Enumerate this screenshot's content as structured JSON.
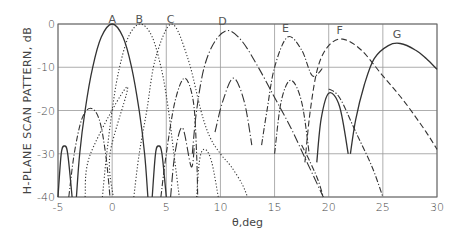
{
  "chart_data": {
    "type": "line",
    "title": "",
    "xlabel": "θ,deg",
    "ylabel": "H-PLANE SCAN PATTERN, dB",
    "xlim": [
      -5,
      30
    ],
    "ylim": [
      -40,
      0
    ],
    "xticks": [
      -5,
      0,
      5,
      10,
      15,
      20,
      25,
      30
    ],
    "xtick_labels": [
      "-5",
      "0",
      "5",
      "10",
      "15",
      "20",
      "25",
      "30"
    ],
    "yticks": [
      0,
      -10,
      -20,
      -30,
      -40
    ],
    "ytick_labels": [
      "0",
      "-10",
      "-20",
      "-30",
      "-40"
    ],
    "grid": true,
    "legend": "none — curves labeled inline A through G above their peaks",
    "series": [
      {
        "name": "A",
        "style": "solid",
        "label_x": 0,
        "peak_x": 0,
        "peak_db": 0,
        "segments": [
          [
            [
              -5,
              -40
            ],
            [
              -4.7,
              -30
            ],
            [
              -4.4,
              -28.2
            ],
            [
              -4.1,
              -30
            ],
            [
              -3.7,
              -40
            ]
          ],
          [
            [
              -3.3,
              -40
            ],
            [
              -3,
              -30
            ],
            [
              -2.5,
              -20
            ],
            [
              -1.8,
              -10
            ],
            [
              -1,
              -3
            ],
            [
              0,
              0
            ],
            [
              1,
              -3
            ],
            [
              1.8,
              -10
            ],
            [
              2.5,
              -20
            ],
            [
              3,
              -30
            ],
            [
              3.3,
              -40
            ]
          ],
          [
            [
              3.7,
              -40
            ],
            [
              4.0,
              -30
            ],
            [
              4.3,
              -28.2
            ],
            [
              4.6,
              -30
            ],
            [
              5,
              -40
            ]
          ]
        ]
      },
      {
        "name": "B",
        "style": "dotted",
        "label_x": 2.5,
        "peak_x": 2.6,
        "peak_db": 0,
        "segments": [
          [
            [
              -0.9,
              -40
            ],
            [
              -0.5,
              -30
            ],
            [
              0,
              -20
            ],
            [
              0.6,
              -11
            ],
            [
              1.5,
              -3
            ],
            [
              2.6,
              0
            ],
            [
              3.7,
              -3
            ],
            [
              4.6,
              -11
            ],
            [
              5.2,
              -20
            ],
            [
              5.7,
              -30
            ],
            [
              6.2,
              -40
            ]
          ],
          [
            [
              -2.5,
              -40
            ],
            [
              -2,
              -30
            ],
            [
              1.4,
              -14.5
            ],
            [
              -0.2,
              -30
            ],
            [
              0.1,
              -40
            ]
          ],
          [
            [
              7.8,
              -40
            ],
            [
              8.1,
              -31
            ],
            [
              8.6,
              -29
            ],
            [
              9.2,
              -32
            ],
            [
              9.8,
              -40
            ]
          ]
        ]
      },
      {
        "name": "C",
        "style": "dotted",
        "label_x": 5.4,
        "peak_x": 5.5,
        "peak_db": 0,
        "segments": [
          [
            [
              2.0,
              -40
            ],
            [
              2.5,
              -30
            ],
            [
              3.2,
              -20
            ],
            [
              4.0,
              -8
            ],
            [
              5.5,
              0
            ],
            [
              7.0,
              -8
            ],
            [
              8.2,
              -20
            ],
            [
              9.0,
              -26
            ],
            [
              10.0,
              -30
            ],
            [
              11.0,
              -33
            ],
            [
              12.0,
              -37
            ],
            [
              12.5,
              -40
            ]
          ]
        ]
      },
      {
        "name": "C-sidelobes",
        "style": "dash-dot",
        "segments": [
          [
            [
              -4.0,
              -40
            ],
            [
              -3.5,
              -30
            ],
            [
              -2.8,
              -22
            ],
            [
              -2.0,
              -19.5
            ],
            [
              -1.2,
              -22
            ],
            [
              -0.6,
              -30
            ],
            [
              -0.2,
              -40
            ]
          ],
          [
            [
              4.5,
              -40
            ],
            [
              5.0,
              -30
            ],
            [
              5.8,
              -18
            ],
            [
              6.7,
              -12.5
            ],
            [
              7.5,
              -18
            ],
            [
              7.8,
              -30
            ],
            [
              7.9,
              -40
            ]
          ]
        ]
      },
      {
        "name": "D",
        "style": "long-dash-dot",
        "label_x": 10.2,
        "peak_x": 10.7,
        "peak_db": -1.5,
        "segments": [
          [
            [
              7.4,
              -30
            ],
            [
              7.8,
              -20
            ],
            [
              8.5,
              -10
            ],
            [
              9.5,
              -4
            ],
            [
              10.7,
              -1.5
            ],
            [
              12,
              -4
            ],
            [
              13.5,
              -10
            ],
            [
              15,
              -17
            ],
            [
              16.5,
              -24
            ],
            [
              18,
              -32
            ],
            [
              19.5,
              -40
            ]
          ],
          [
            [
              5.4,
              -40
            ],
            [
              5.8,
              -30
            ],
            [
              6.5,
              -24
            ],
            [
              7.3,
              -33
            ],
            [
              7.6,
              -28
            ]
          ],
          [
            [
              9.5,
              -25
            ],
            [
              10.2,
              -18
            ],
            [
              11.2,
              -12.5
            ],
            [
              12.2,
              -18
            ],
            [
              12.9,
              -28
            ]
          ]
        ]
      },
      {
        "name": "E",
        "style": "dash-dot",
        "label_x": 16,
        "peak_x": 16.2,
        "peak_db": -3,
        "segments": [
          [
            [
              13.8,
              -28
            ],
            [
              14.3,
              -20
            ],
            [
              15,
              -10
            ],
            [
              16.2,
              -3
            ],
            [
              17.5,
              -6
            ],
            [
              18.5,
              -12
            ],
            [
              19.5,
              -10
            ]
          ],
          [
            [
              15.0,
              -30
            ],
            [
              15.6,
              -18
            ],
            [
              16.5,
              -13
            ],
            [
              17.5,
              -18
            ],
            [
              18.2,
              -30
            ]
          ],
          [
            [
              17.5,
              -28
            ],
            [
              18.3,
              -32
            ],
            [
              19,
              -36
            ],
            [
              19.5,
              -40
            ]
          ],
          [
            [
              20,
              -15
            ],
            [
              21,
              -17
            ],
            [
              22.5,
              -25
            ],
            [
              24,
              -33
            ],
            [
              25,
              -40
            ]
          ]
        ]
      },
      {
        "name": "F",
        "style": "dashed",
        "label_x": 21,
        "peak_x": 21.3,
        "peak_db": -3.5,
        "segments": [
          [
            [
              17.8,
              -32
            ],
            [
              18.3,
              -20
            ],
            [
              19,
              -10
            ],
            [
              20,
              -5
            ],
            [
              21.3,
              -3.5
            ],
            [
              23,
              -6
            ],
            [
              25,
              -12
            ],
            [
              27,
              -18
            ],
            [
              29,
              -25
            ],
            [
              30,
              -29
            ]
          ]
        ]
      },
      {
        "name": "G",
        "style": "solid",
        "label_x": 26.3,
        "peak_x": 26.6,
        "peak_db": -4.5,
        "segments": [
          [
            [
              18.9,
              -32
            ],
            [
              19.3,
              -22
            ],
            [
              20,
              -16
            ],
            [
              21,
              -19
            ],
            [
              21.8,
              -30
            ]
          ],
          [
            [
              22.0,
              -30
            ],
            [
              22.5,
              -22
            ],
            [
              23.3,
              -14
            ],
            [
              24.2,
              -8
            ],
            [
              25.5,
              -5
            ],
            [
              26.6,
              -4.5
            ],
            [
              28,
              -6
            ],
            [
              29,
              -8
            ],
            [
              30,
              -10.5
            ]
          ]
        ]
      }
    ]
  }
}
